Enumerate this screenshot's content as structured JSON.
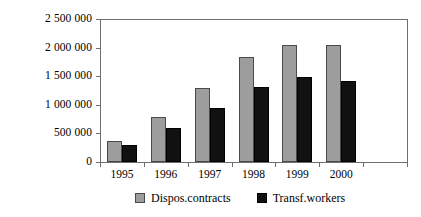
{
  "chart_data": {
    "type": "bar",
    "title": "",
    "subtitle": "",
    "xlabel": "",
    "ylabel": "",
    "categories": [
      "1995",
      "1996",
      "1997",
      "1998",
      "1999",
      "2000",
      ""
    ],
    "series": [
      {
        "name": "Dispos.contracts",
        "color": "#9d9d9d",
        "values": [
          370000,
          790000,
          1300000,
          1840000,
          2040000,
          2040000,
          null
        ]
      },
      {
        "name": "Transf.workers",
        "color": "#111111",
        "values": [
          290000,
          600000,
          950000,
          1320000,
          1480000,
          1420000,
          null
        ]
      }
    ],
    "ylim": [
      0,
      2500000
    ],
    "y_ticks": [
      0,
      500000,
      1000000,
      1500000,
      2000000,
      2500000
    ],
    "y_tick_labels": [
      "0",
      "500 000",
      "1 000 000",
      "1 500 000",
      "2 000 000",
      "2 500 000"
    ],
    "grid": false,
    "legend_position": "bottom",
    "legend": [
      "Dispos.contracts",
      "Transf.workers"
    ],
    "annotations": []
  }
}
